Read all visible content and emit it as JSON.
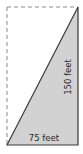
{
  "diagram": {
    "type": "right-triangle-in-rectangle",
    "labels": {
      "base": "75 feet",
      "height": "150 feet"
    },
    "dimensions": {
      "base_feet": 75,
      "height_feet": 150
    },
    "colors": {
      "triangle_fill": "#d2d2d2",
      "stroke": "#3a3a3a",
      "dashed_stroke": "#8a8a8a",
      "background": "#ffffff"
    }
  }
}
